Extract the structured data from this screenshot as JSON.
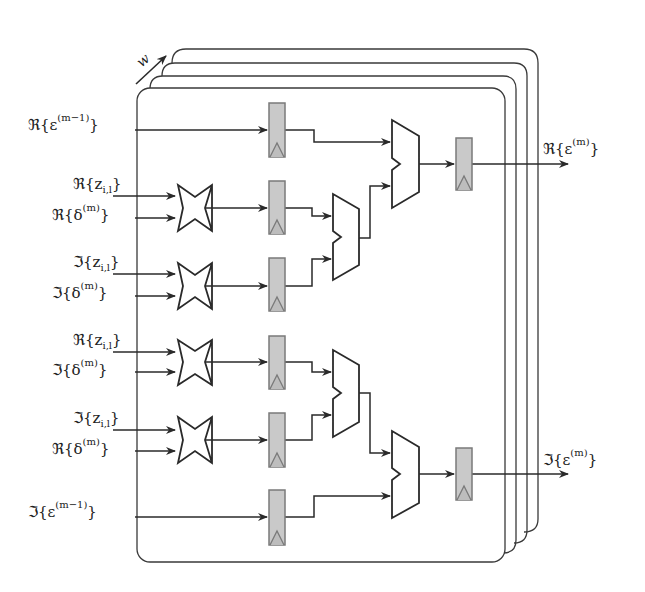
{
  "diagram": {
    "stack_label": "w",
    "colors": {
      "line": "#2a2a2a",
      "register_fill": "#c9c9c9",
      "register_border": "#7a7a7a",
      "background": "#ffffff"
    },
    "inputs": [
      {
        "id": "re_eps_prev",
        "prefix": "ℜ{ε",
        "sup": "(m−1)",
        "suffix": "}"
      },
      {
        "id": "re_z_1",
        "prefix": "ℜ{z",
        "sub": "i,l",
        "suffix": "}"
      },
      {
        "id": "re_delta_1",
        "prefix": "ℜ{δ",
        "sup": "(m)",
        "suffix": "}"
      },
      {
        "id": "im_z_1",
        "prefix": "ℑ{z",
        "sub": "i,l",
        "suffix": "}"
      },
      {
        "id": "im_delta_1",
        "prefix": "ℑ{δ",
        "sup": "(m)",
        "suffix": "}"
      },
      {
        "id": "re_z_2",
        "prefix": "ℜ{z",
        "sub": "i,l",
        "suffix": "}"
      },
      {
        "id": "im_delta_2",
        "prefix": "ℑ{δ",
        "sup": "(m)",
        "suffix": "}"
      },
      {
        "id": "im_z_2",
        "prefix": "ℑ{z",
        "sub": "i,l",
        "suffix": "}"
      },
      {
        "id": "re_delta_2",
        "prefix": "ℜ{δ",
        "sup": "(m)",
        "suffix": "}"
      },
      {
        "id": "im_eps_prev",
        "prefix": "ℑ{ε",
        "sup": "(m−1)",
        "suffix": "}"
      }
    ],
    "outputs": [
      {
        "id": "re_eps",
        "prefix": "ℜ{ε",
        "sup": "(m)",
        "suffix": "}"
      },
      {
        "id": "im_eps",
        "prefix": "ℑ{ε",
        "sup": "(m)",
        "suffix": "}"
      }
    ],
    "components": {
      "multipliers": 4,
      "adders": 4,
      "registers": 8,
      "stacked_frames": 4
    }
  }
}
